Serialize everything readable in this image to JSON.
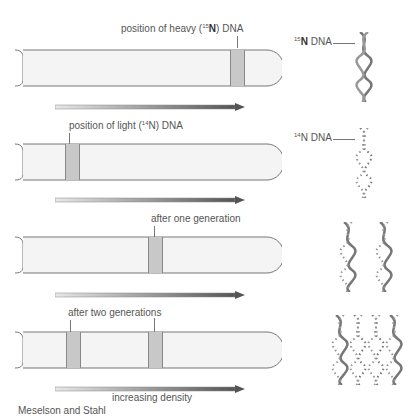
{
  "panels": [
    {
      "label_pre": "position of heavy (",
      "label_sup": "15",
      "label_bold": "N",
      "label_post": ") DNA",
      "bands": [
        237
      ]
    },
    {
      "label_pre": "position of light (",
      "label_sup": "14",
      "label_bold": "",
      "label_post": "N) DNA",
      "bands": [
        65
      ]
    },
    {
      "label": "after one generation",
      "bands": [
        148
      ]
    },
    {
      "label": "after two generations",
      "bands": [
        66,
        148
      ]
    }
  ],
  "dna_labels": {
    "heavy_sup": "15",
    "heavy_bold": "N",
    "heavy_post": " DNA",
    "light_sup": "14",
    "light_post": "N DNA"
  },
  "axis_label": "increasing density",
  "caption_partial": "Meselson and Stahl",
  "colors": {
    "band": "#c8c8c8",
    "tube_fill": "#f4f4f4",
    "arrow_start": "#e8e8e8",
    "arrow_end": "#555555",
    "dna": "#777777"
  }
}
